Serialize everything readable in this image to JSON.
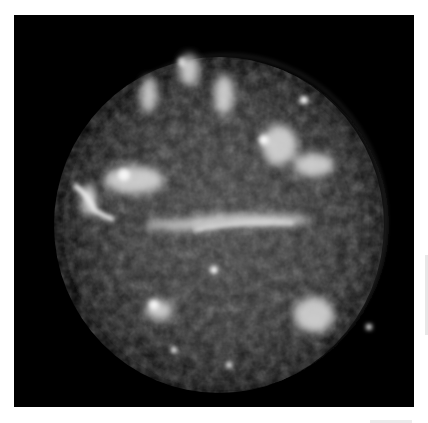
{
  "image": {
    "subject": "supernova remnant nebula",
    "style": "grayscale astronomical image",
    "colors": {
      "background": "#ffffff",
      "frame": "#000000",
      "nebula_dim": "#3a3a3a",
      "nebula_mid": "#8a8a8a",
      "nebula_bright": "#f0f0f0"
    }
  }
}
